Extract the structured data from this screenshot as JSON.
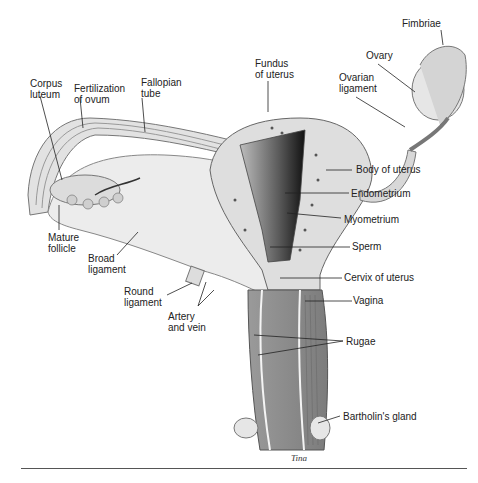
{
  "diagram": {
    "labels": {
      "corpus_luteum": "Corpus\nluteum",
      "fertilization": "Fertilization\nof ovum",
      "fallopian_tube": "Fallopian\ntube",
      "fundus": "Fundus\nof uterus",
      "ovary": "Ovary",
      "fimbriae": "Fimbriae",
      "ovarian_ligament": "Ovarian\nligament",
      "body_of_uterus": "Body of uterus",
      "endometrium": "Endometrium",
      "myometrium": "Myometrium",
      "sperm": "Sperm",
      "cervix": "Cervix of uterus",
      "vagina": "Vagina",
      "rugae": "Rugae",
      "bartholins_gland": "Bartholin's gland",
      "mature_follicle": "Mature\nfollicle",
      "broad_ligament": "Broad\nligament",
      "round_ligament": "Round\nligament",
      "artery_vein": "Artery\nand vein"
    },
    "signature": "Tina",
    "colors": {
      "tissue_light": "#e4e4e4",
      "tissue_mid": "#c8c8c8",
      "tissue_dark": "#8a8a8a",
      "cavity": "#2a2a2a",
      "leader": "#222222"
    }
  }
}
